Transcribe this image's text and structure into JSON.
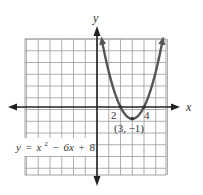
{
  "chart_data": {
    "type": "line",
    "title": "",
    "equation": "y = x² − 6x + 8",
    "equation_parts": {
      "prefix": "y = x",
      "exp": "2",
      "suffix": " − 6x + 8"
    },
    "xlabel": "x",
    "ylabel": "y",
    "xlim": [
      -6,
      6
    ],
    "ylim": [
      -6,
      6
    ],
    "grid": true,
    "grid_step": 1,
    "series": [
      {
        "name": "y = x^2 - 6x + 8",
        "x": [
          0.4,
          1,
          2,
          3,
          4,
          5,
          5.6
        ],
        "values": [
          5.76,
          3,
          0,
          -1,
          0,
          3,
          5.76
        ]
      }
    ],
    "annotations": [
      {
        "text": "2",
        "x": 2,
        "y": 0,
        "role": "x-intercept"
      },
      {
        "text": "4",
        "x": 4,
        "y": 0,
        "role": "x-intercept"
      },
      {
        "text": "(3, −1)",
        "x": 3,
        "y": -1,
        "role": "vertex"
      }
    ],
    "colors": {
      "curve": "#555555",
      "axes": "#222222",
      "grid": "#9a9a9a"
    }
  },
  "labels": {
    "x_axis": "x",
    "y_axis": "y",
    "intercept_left": "2",
    "intercept_right": "4",
    "vertex": "(3, −1)",
    "eq_y": "y",
    "eq_eq": "=",
    "eq_x": "x",
    "eq_exp": "2",
    "eq_rest_minus": "−",
    "eq_6x": "6x",
    "eq_plus": "+",
    "eq_8": "8"
  }
}
